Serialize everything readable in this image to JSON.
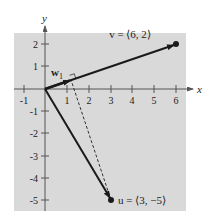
{
  "figure": {
    "type": "vector-projection-diagram",
    "axes": {
      "x_label": "x",
      "y_label": "y",
      "x_ticks": [
        "-1",
        "1",
        "2",
        "3",
        "4",
        "5",
        "6"
      ],
      "y_ticks": [
        "2",
        "1",
        "-1",
        "-2",
        "-3",
        "-4",
        "-5"
      ]
    },
    "vectors": {
      "v": {
        "label": "v = ⟨6, 2⟩",
        "x": 6,
        "y": 2
      },
      "u": {
        "label": "u = ⟨3, −5⟩",
        "x": 3,
        "y": -5
      },
      "w1": {
        "label": "w",
        "subscript": "1",
        "x": 1.2,
        "y": 0.4
      }
    },
    "colors": {
      "background": "#d9d9d9",
      "lines": "#1a1a1a"
    }
  }
}
